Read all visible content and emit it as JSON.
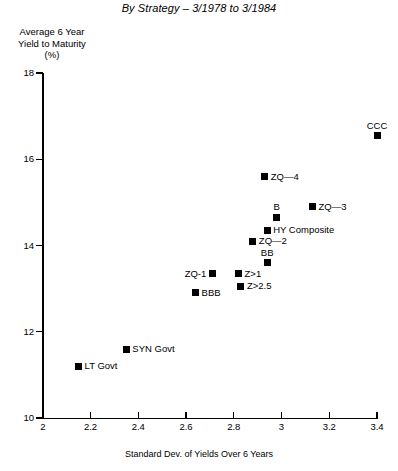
{
  "chart_data": {
    "type": "scatter",
    "title": "By Strategy – 3/1978 to 3/1984",
    "ylabel": "Average 6 Year\nYield to Maturity\n(%)",
    "ylabel_line1": "Average 6 Year",
    "ylabel_line2": "Yield to Maturity",
    "ylabel_line3": "(%)",
    "xlabel": "Standard Dev. of Yields Over 6 Years",
    "xlim": [
      2,
      3.4
    ],
    "ylim": [
      10,
      18
    ],
    "xticks": [
      "2",
      "2.2",
      "2.4",
      "2.6",
      "2.8",
      "3",
      "3.2",
      "3.4"
    ],
    "xtick_values": [
      2,
      2.2,
      2.4,
      2.6,
      2.8,
      3,
      3.2,
      3.4
    ],
    "yticks": [
      "10",
      "12",
      "14",
      "16",
      "18"
    ],
    "ytick_values": [
      10,
      12,
      14,
      16,
      18
    ],
    "grid": false,
    "legend": "none",
    "marker": "filled-square",
    "marker_color": "#000000",
    "points": [
      {
        "label": "CCC",
        "x": 3.4,
        "y": 16.55,
        "label_pos": "above"
      },
      {
        "label": "ZQ—4",
        "x": 2.93,
        "y": 15.6,
        "label_pos": "right"
      },
      {
        "label": "ZQ—3",
        "x": 3.13,
        "y": 14.9,
        "label_pos": "right"
      },
      {
        "label": "B",
        "x": 2.98,
        "y": 14.65,
        "label_pos": "above"
      },
      {
        "label": "HY Composite",
        "x": 2.94,
        "y": 14.35,
        "label_pos": "right"
      },
      {
        "label": "ZQ—2",
        "x": 2.88,
        "y": 14.1,
        "label_pos": "right"
      },
      {
        "label": "BB",
        "x": 2.94,
        "y": 13.6,
        "label_pos": "above"
      },
      {
        "label": "ZQ-1",
        "x": 2.71,
        "y": 13.35,
        "label_pos": "left"
      },
      {
        "label": "Z>1",
        "x": 2.82,
        "y": 13.35,
        "label_pos": "right"
      },
      {
        "label": "Z>2.5",
        "x": 2.83,
        "y": 13.05,
        "label_pos": "right"
      },
      {
        "label": "BBB",
        "x": 2.64,
        "y": 12.9,
        "label_pos": "right"
      },
      {
        "label": "SYN Govt",
        "x": 2.35,
        "y": 11.6,
        "label_pos": "right"
      },
      {
        "label": "LT Govt",
        "x": 2.15,
        "y": 11.2,
        "label_pos": "right"
      }
    ]
  }
}
